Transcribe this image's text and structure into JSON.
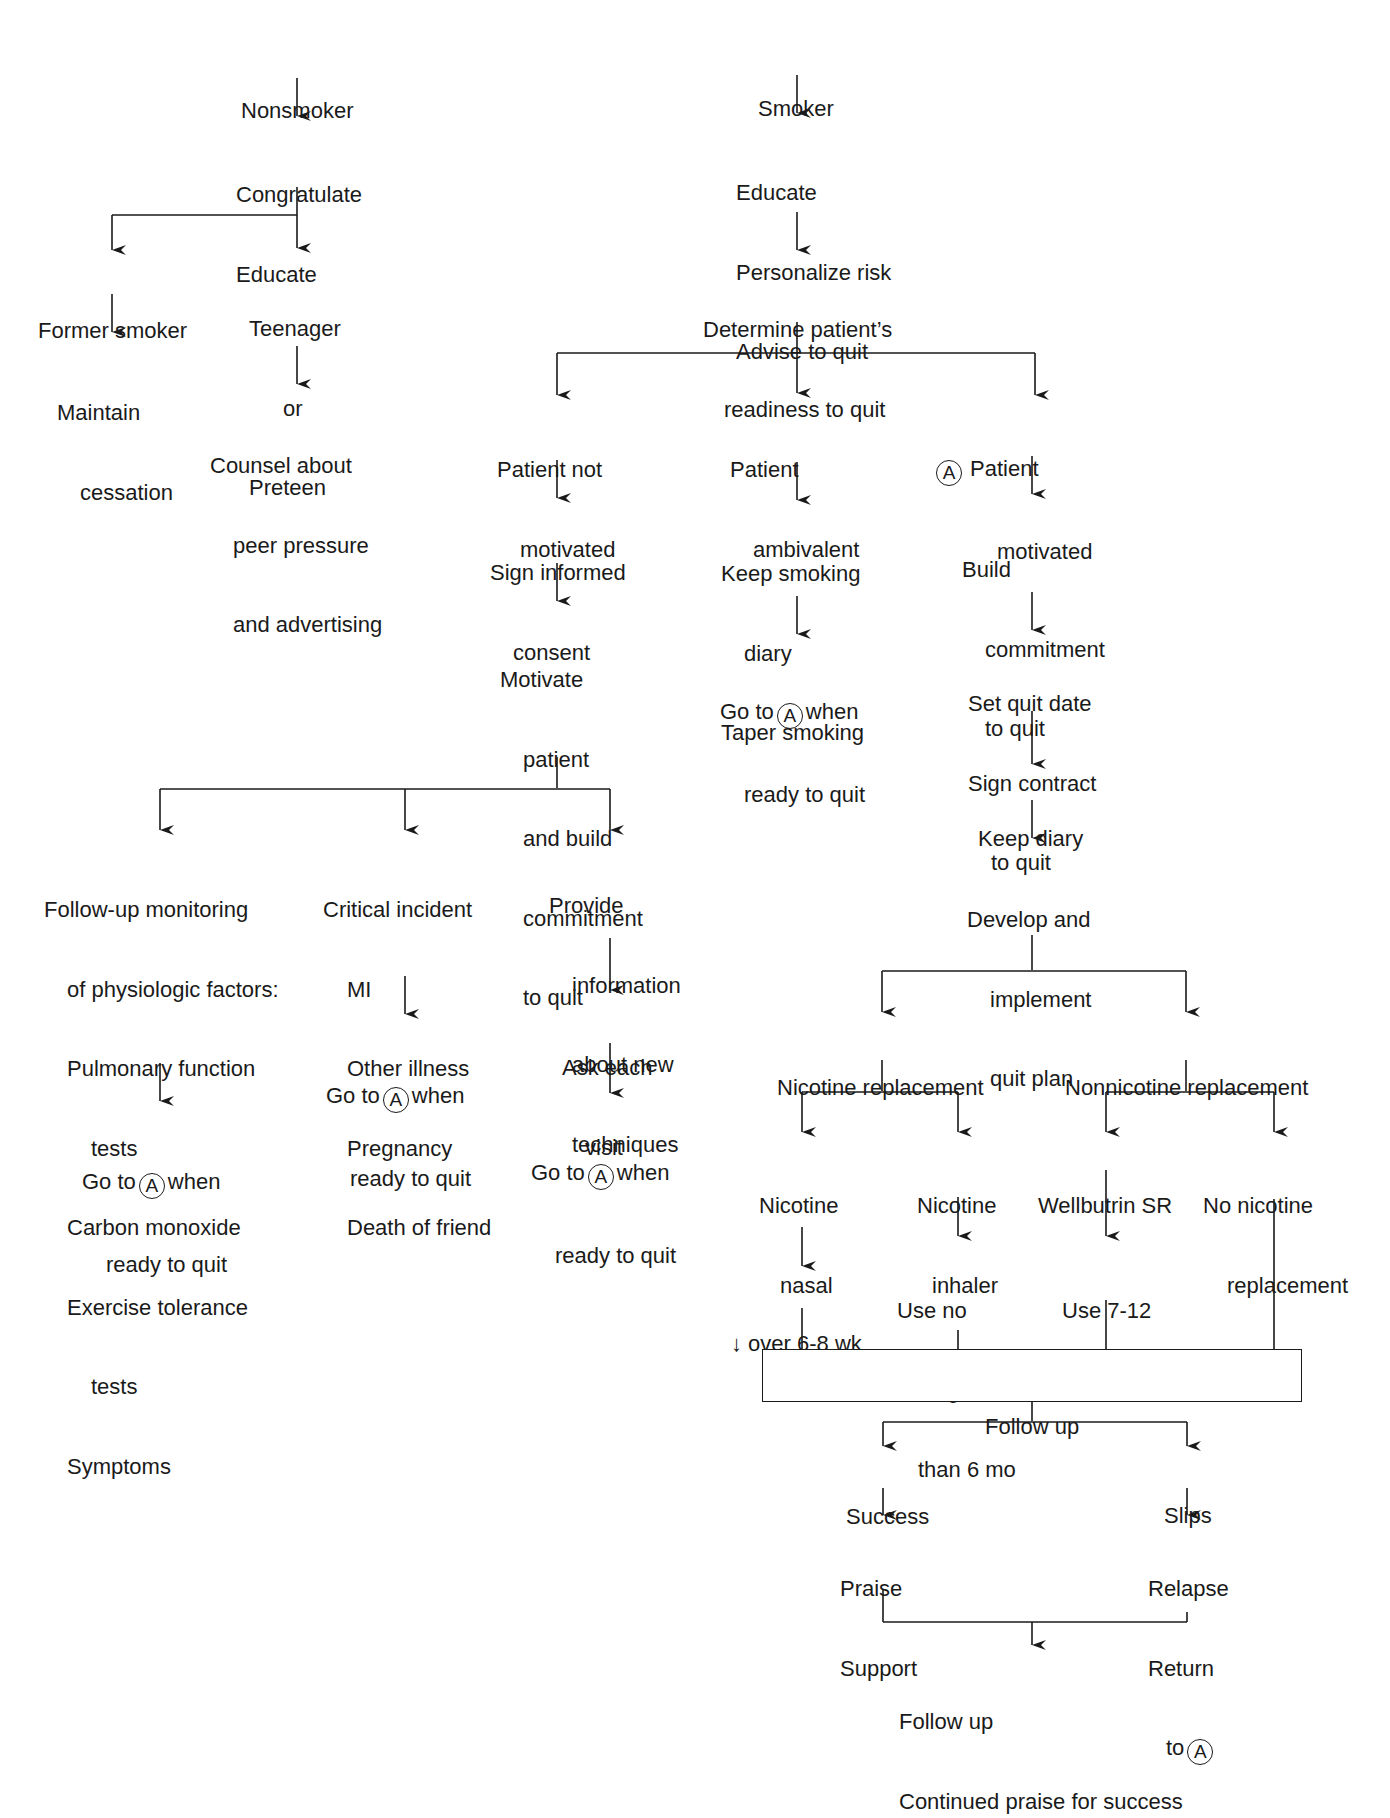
{
  "diagram": {
    "type": "flowchart",
    "marker_label": "A",
    "line_color": "#1a1a1a",
    "nodes": {
      "nonsmoker": {
        "lines": [
          "Nonsmoker"
        ]
      },
      "congratulate": {
        "lines": [
          "Congratulate",
          "Educate"
        ]
      },
      "former_smoker": {
        "lines": [
          "Former smoker"
        ]
      },
      "maintain": {
        "lines": [
          "Maintain",
          "cessation"
        ]
      },
      "teenager": {
        "lines": [
          "Teenager",
          "or",
          "Preteen"
        ]
      },
      "counsel": {
        "lines": [
          "Counsel about",
          "peer pressure",
          "and advertising"
        ]
      },
      "smoker": {
        "lines": [
          "Smoker"
        ]
      },
      "educate": {
        "lines": [
          "Educate",
          "Personalize risk",
          "Advise to quit"
        ]
      },
      "determine": {
        "lines": [
          "Determine patient’s",
          "readiness to quit"
        ]
      },
      "not_motivated": {
        "lines": [
          "Patient not",
          "motivated"
        ]
      },
      "sign_consent": {
        "lines": [
          "Sign informed",
          "consent"
        ]
      },
      "motivate": {
        "lines": [
          "Motivate",
          "patient",
          "and build",
          "commitment",
          "to quit"
        ]
      },
      "followup_monitor": {
        "lines": [
          "Follow-up monitoring",
          "of physiologic factors:",
          "Pulmonary function",
          "tests",
          "Carbon monoxide",
          "Exercise tolerance",
          "tests",
          "Symptoms"
        ]
      },
      "goto_a_1": {
        "prefix": "Go to",
        "suffix": "when",
        "line2": "ready to quit"
      },
      "critical": {
        "lines": [
          "Critical incident",
          "MI",
          "Other illness",
          "Pregnancy",
          "Death of friend"
        ]
      },
      "goto_a_2": {
        "prefix": "Go to",
        "suffix": "when",
        "line2": "ready to quit"
      },
      "provide_info": {
        "lines": [
          "Provide",
          "information",
          "about new",
          "techniques"
        ]
      },
      "ask_visit": {
        "lines": [
          "Ask each",
          "visit"
        ]
      },
      "goto_a_3": {
        "prefix": "Go to",
        "suffix": "when",
        "line2": "ready to quit"
      },
      "ambivalent": {
        "lines": [
          "Patient",
          "ambivalent"
        ]
      },
      "keep_smoking_diary": {
        "lines": [
          "Keep smoking",
          "diary",
          "Taper smoking"
        ]
      },
      "goto_a_4": {
        "prefix": "Go to",
        "suffix": "when",
        "line2": "ready to quit"
      },
      "motivated": {
        "line1": "Patient",
        "line2": "motivated"
      },
      "build_commitment": {
        "lines": [
          "Build",
          "commitment",
          "to quit"
        ]
      },
      "set_quit_date": {
        "lines": [
          "Set quit date",
          "Sign contract",
          "to quit"
        ]
      },
      "keep_diary": {
        "lines": [
          "Keep diary"
        ]
      },
      "develop_plan": {
        "lines": [
          "Develop and",
          "implement",
          "quit plan"
        ]
      },
      "nicotine_replacement": {
        "lines": [
          "Nicotine replacement"
        ]
      },
      "nonnicotine_replacement": {
        "lines": [
          "Nonnicotine replacement"
        ]
      },
      "nasal_spray": {
        "lines": [
          "Nicotine",
          "nasal",
          "spray"
        ]
      },
      "nasal_duration": {
        "lines": [
          "↓ over 6-8 wk"
        ]
      },
      "inhaler": {
        "lines": [
          "Nicotine",
          "inhaler"
        ]
      },
      "inhaler_duration": {
        "lines": [
          "Use no",
          "longer",
          "than 6 mo"
        ]
      },
      "wellbutrin": {
        "lines": [
          "Wellbutrin SR"
        ]
      },
      "wellbutrin_duration": {
        "lines": [
          "Use 7-12",
          "weeks"
        ]
      },
      "no_nicotine": {
        "lines": [
          "No nicotine",
          "replacement"
        ]
      },
      "follow_up_box": {
        "lines": [
          "Follow up"
        ]
      },
      "success": {
        "lines": [
          "Success"
        ]
      },
      "praise": {
        "lines": [
          "Praise",
          "Support"
        ]
      },
      "slips": {
        "lines": [
          "Slips"
        ]
      },
      "relapse": {
        "line1": "Relapse",
        "line2": "Return",
        "line3_prefix": "to"
      },
      "final": {
        "lines": [
          "Follow up",
          "Continued praise for success"
        ]
      }
    }
  }
}
